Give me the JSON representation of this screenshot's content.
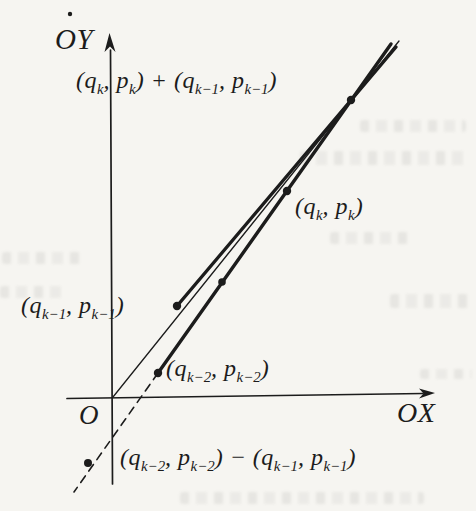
{
  "page": {
    "background": "#f6f5f1",
    "ink": "#1c1c1c"
  },
  "figure": {
    "axes": {
      "y_label": "OY",
      "x_label": "OX",
      "origin_label": "O"
    },
    "labels": {
      "sum_top": "(q_{k}, p_{k}) + (q_{k−1}, p_{k−1})",
      "convergent_k": "(q_{k}, p_{k})",
      "convergent_k_minus_1": "(q_{k−1}, p_{k−1})",
      "convergent_k_minus_2": "(q_{k−2}, p_{k−2})",
      "diff_bottom": "(q_{k−2}, p_{k−2}) − (q_{k−1}, p_{k−1})"
    },
    "lines": [
      {
        "name": "y-axis-line",
        "x1": 112.5,
        "y1": 484,
        "x2": 110.5,
        "y2": 50,
        "width": 1.7
      },
      {
        "name": "x-axis-line",
        "x1": 67,
        "y1": 398.5,
        "x2": 423,
        "y2": 393.5,
        "width": 1.7
      },
      {
        "name": "alpha-ray-line",
        "x1": 113,
        "y1": 397,
        "x2": 399,
        "y2": 41,
        "width": 1.3
      },
      {
        "name": "upper-chain-segment",
        "x1": 177,
        "y1": 306,
        "x2": 396,
        "y2": 47,
        "width": 3.4
      },
      {
        "name": "lower-chain-segment",
        "x1": 158,
        "y1": 373,
        "x2": 391,
        "y2": 44,
        "width": 3.4
      },
      {
        "name": "difference-dashed-line",
        "x1": 158,
        "y1": 373,
        "x2": 74,
        "y2": 492,
        "width": 1.6,
        "dash": "8 6"
      }
    ],
    "arrows": [
      {
        "name": "y-axis-arrowhead",
        "points": "109.5,33 104.5,52 110,46.5 115.5,52"
      },
      {
        "name": "x-axis-arrowhead",
        "points": "435,393 419,388.5 423.5,393.5 419,398.5"
      }
    ],
    "dots": [
      {
        "name": "point-convergent-k-1",
        "x": 177,
        "y": 306,
        "r": 4.2
      },
      {
        "name": "point-convergent-k-2",
        "x": 158,
        "y": 373,
        "r": 4.2
      },
      {
        "name": "point-intermediate-step",
        "x": 222,
        "y": 282,
        "r": 3.8
      },
      {
        "name": "point-convergent-k",
        "x": 287,
        "y": 191,
        "r": 4.2
      },
      {
        "name": "point-sum",
        "x": 351,
        "y": 100,
        "r": 4.2
      },
      {
        "name": "point-difference",
        "x": 88,
        "y": 463,
        "r": 4.0
      },
      {
        "name": "stray-ink-dot",
        "x": 70,
        "y": 14,
        "r": 2.2
      }
    ]
  }
}
